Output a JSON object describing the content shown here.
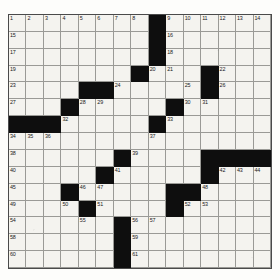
{
  "puzzle": {
    "title": "Crossword Grid",
    "rows": 15,
    "cols": 15,
    "colors": {
      "block": "#0e0e0e",
      "cell": "#f4f3ef",
      "gridline": "#6d6d6d",
      "number_text": "#1a1a1a",
      "page_background": "#fdfdfb"
    },
    "block_cells": [
      [
        1,
        9
      ],
      [
        2,
        9
      ],
      [
        3,
        9
      ],
      [
        4,
        8
      ],
      [
        4,
        12
      ],
      [
        5,
        5
      ],
      [
        5,
        6
      ],
      [
        5,
        12
      ],
      [
        6,
        4
      ],
      [
        6,
        10
      ],
      [
        7,
        1
      ],
      [
        7,
        2
      ],
      [
        7,
        3
      ],
      [
        7,
        9
      ],
      [
        9,
        7
      ],
      [
        9,
        12
      ],
      [
        9,
        13
      ],
      [
        9,
        14
      ],
      [
        9,
        15
      ],
      [
        10,
        6
      ],
      [
        10,
        12
      ],
      [
        11,
        4
      ],
      [
        11,
        10
      ],
      [
        11,
        11
      ],
      [
        12,
        5
      ],
      [
        12,
        10
      ],
      [
        13,
        7
      ],
      [
        14,
        7
      ],
      [
        15,
        7
      ]
    ],
    "numbered_cells": [
      {
        "n": 1,
        "row": 1,
        "col": 1
      },
      {
        "n": 2,
        "row": 1,
        "col": 2
      },
      {
        "n": 3,
        "row": 1,
        "col": 3
      },
      {
        "n": 4,
        "row": 1,
        "col": 4
      },
      {
        "n": 5,
        "row": 1,
        "col": 5
      },
      {
        "n": 6,
        "row": 1,
        "col": 6
      },
      {
        "n": 7,
        "row": 1,
        "col": 7
      },
      {
        "n": 8,
        "row": 1,
        "col": 8
      },
      {
        "n": 9,
        "row": 1,
        "col": 10
      },
      {
        "n": 10,
        "row": 1,
        "col": 11
      },
      {
        "n": 11,
        "row": 1,
        "col": 12
      },
      {
        "n": 12,
        "row": 1,
        "col": 13
      },
      {
        "n": 13,
        "row": 1,
        "col": 14
      },
      {
        "n": 14,
        "row": 1,
        "col": 15
      },
      {
        "n": 15,
        "row": 2,
        "col": 1
      },
      {
        "n": 16,
        "row": 2,
        "col": 10
      },
      {
        "n": 17,
        "row": 3,
        "col": 1
      },
      {
        "n": 18,
        "row": 3,
        "col": 10
      },
      {
        "n": 19,
        "row": 4,
        "col": 1
      },
      {
        "n": 20,
        "row": 4,
        "col": 9
      },
      {
        "n": 21,
        "row": 4,
        "col": 10
      },
      {
        "n": 22,
        "row": 4,
        "col": 13
      },
      {
        "n": 23,
        "row": 5,
        "col": 1
      },
      {
        "n": 24,
        "row": 5,
        "col": 7
      },
      {
        "n": 25,
        "row": 5,
        "col": 11
      },
      {
        "n": 26,
        "row": 5,
        "col": 13
      },
      {
        "n": 27,
        "row": 6,
        "col": 1
      },
      {
        "n": 28,
        "row": 6,
        "col": 5
      },
      {
        "n": 29,
        "row": 6,
        "col": 6
      },
      {
        "n": 30,
        "row": 6,
        "col": 11
      },
      {
        "n": 31,
        "row": 6,
        "col": 12
      },
      {
        "n": 32,
        "row": 7,
        "col": 4
      },
      {
        "n": 33,
        "row": 7,
        "col": 10
      },
      {
        "n": 34,
        "row": 8,
        "col": 1
      },
      {
        "n": 35,
        "row": 8,
        "col": 2
      },
      {
        "n": 36,
        "row": 8,
        "col": 3
      },
      {
        "n": 37,
        "row": 8,
        "col": 9
      },
      {
        "n": 38,
        "row": 9,
        "col": 1
      },
      {
        "n": 39,
        "row": 9,
        "col": 8
      },
      {
        "n": 40,
        "row": 10,
        "col": 1
      },
      {
        "n": 41,
        "row": 10,
        "col": 7
      },
      {
        "n": 42,
        "row": 10,
        "col": 13
      },
      {
        "n": 43,
        "row": 10,
        "col": 14
      },
      {
        "n": 44,
        "row": 10,
        "col": 15
      },
      {
        "n": 45,
        "row": 11,
        "col": 1
      },
      {
        "n": 46,
        "row": 11,
        "col": 5
      },
      {
        "n": 47,
        "row": 11,
        "col": 6
      },
      {
        "n": 48,
        "row": 11,
        "col": 12
      },
      {
        "n": 49,
        "row": 12,
        "col": 1
      },
      {
        "n": 50,
        "row": 12,
        "col": 4
      },
      {
        "n": 51,
        "row": 12,
        "col": 6
      },
      {
        "n": 52,
        "row": 12,
        "col": 11
      },
      {
        "n": 53,
        "row": 12,
        "col": 12
      },
      {
        "n": 54,
        "row": 13,
        "col": 1
      },
      {
        "n": 55,
        "row": 13,
        "col": 5
      },
      {
        "n": 56,
        "row": 13,
        "col": 8
      },
      {
        "n": 57,
        "row": 13,
        "col": 9
      },
      {
        "n": 58,
        "row": 14,
        "col": 1
      },
      {
        "n": 59,
        "row": 14,
        "col": 8
      },
      {
        "n": 60,
        "row": 15,
        "col": 1
      },
      {
        "n": 61,
        "row": 15,
        "col": 8
      }
    ],
    "filled_letters": []
  }
}
